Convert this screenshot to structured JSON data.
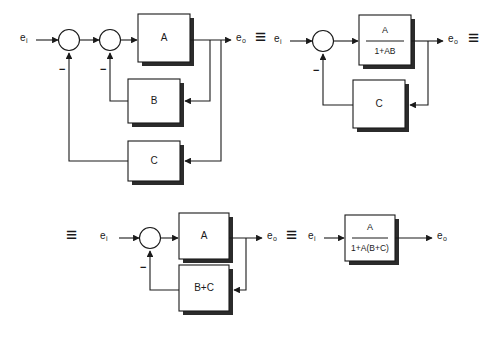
{
  "figure": {
    "background_color": "#ffffff",
    "line_color": "#1a1a1a",
    "shadow_color": "#2b2b2b",
    "equivalence_symbol": "≡"
  },
  "signals": {
    "input": "e",
    "input_sub": "i",
    "output": "e",
    "output_sub": "o",
    "negative_sign": "−"
  },
  "equivalences": [
    {
      "name": "equiv-1",
      "symbol": "≡"
    },
    {
      "name": "equiv-2",
      "symbol": "≡"
    },
    {
      "name": "equiv-3",
      "symbol": "≡"
    },
    {
      "name": "equiv-4",
      "symbol": "≡"
    }
  ],
  "diagrams": [
    {
      "id": "diagram-1",
      "caption": "Original system with two nested feedback loops",
      "input_label": "e",
      "input_sub": "i",
      "output_label": "e",
      "output_sub": "o",
      "blocks": [
        {
          "name": "block-a",
          "label": "A",
          "role": "forward-path"
        },
        {
          "name": "block-b",
          "label": "B",
          "role": "inner-feedback"
        },
        {
          "name": "block-c",
          "label": "C",
          "role": "outer-feedback"
        }
      ],
      "summing_junctions": [
        {
          "name": "summing-junction-outer",
          "sign": "−"
        },
        {
          "name": "summing-junction-inner",
          "sign": "−"
        }
      ]
    },
    {
      "id": "diagram-2",
      "caption": "Inner loop collapsed to A/(1+AB)",
      "input_label": "e",
      "input_sub": "i",
      "output_label": "e",
      "output_sub": "o",
      "blocks": [
        {
          "name": "block-a-over-1-plus-ab",
          "numerator": "A",
          "denominator": "1+AB",
          "role": "forward-path"
        },
        {
          "name": "block-c",
          "label": "C",
          "role": "outer-feedback"
        }
      ],
      "summing_junctions": [
        {
          "name": "summing-junction-outer",
          "sign": "−"
        }
      ]
    },
    {
      "id": "diagram-3",
      "caption": "Parallel feedback paths combined to B+C",
      "input_label": "e",
      "input_sub": "i",
      "output_label": "e",
      "output_sub": "o",
      "blocks": [
        {
          "name": "block-a",
          "label": "A",
          "role": "forward-path"
        },
        {
          "name": "block-b-plus-c",
          "label": "B+C",
          "role": "feedback"
        }
      ],
      "summing_junctions": [
        {
          "name": "summing-junction",
          "sign": "−"
        }
      ]
    },
    {
      "id": "diagram-4",
      "caption": "Fully reduced closed-loop transfer function",
      "input_label": "e",
      "input_sub": "i",
      "output_label": "e",
      "output_sub": "o",
      "blocks": [
        {
          "name": "block-closed-loop",
          "numerator": "A",
          "denominator": "1+A(B+C)",
          "role": "closed-loop"
        }
      ],
      "summing_junctions": []
    }
  ]
}
